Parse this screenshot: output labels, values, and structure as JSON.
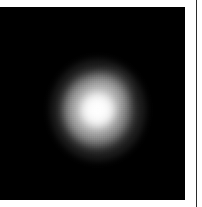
{
  "figure": {
    "title": "",
    "caption": "",
    "background_color": "#ffffff"
  },
  "image_panel": {
    "name": "image-panel",
    "background_color": "#000000",
    "colormap": "grayscale",
    "x_px": 0,
    "y_px": 7,
    "width_px": 185,
    "height_px": 193,
    "axis_labels_visible": false,
    "tick_labels_visible": false,
    "colorbar_visible": false,
    "annotations": []
  },
  "chart_data": {
    "type": "heatmap",
    "title": "",
    "subtitle": "",
    "xlabel": "",
    "ylabel": "",
    "colormap": "gray",
    "grid": false,
    "legend": "none",
    "xlim": [
      0,
      185
    ],
    "ylim": [
      0,
      193
    ],
    "xticklabels": [],
    "yticklabels": [],
    "background_value": 0,
    "value_range": [
      0,
      255
    ],
    "sources": [
      {
        "label": "",
        "center_x_px": 98,
        "center_y_px": 110,
        "peak_value": 248,
        "core_radius_px": 17,
        "halo_radius_px": 40,
        "shape": "diffuse-round",
        "texture": "pixelated-noise"
      }
    ]
  },
  "divider": {
    "name": "panel-divider",
    "color": "#2b2b2b",
    "x_px": 196,
    "width_px": 1,
    "orientation": "vertical"
  }
}
